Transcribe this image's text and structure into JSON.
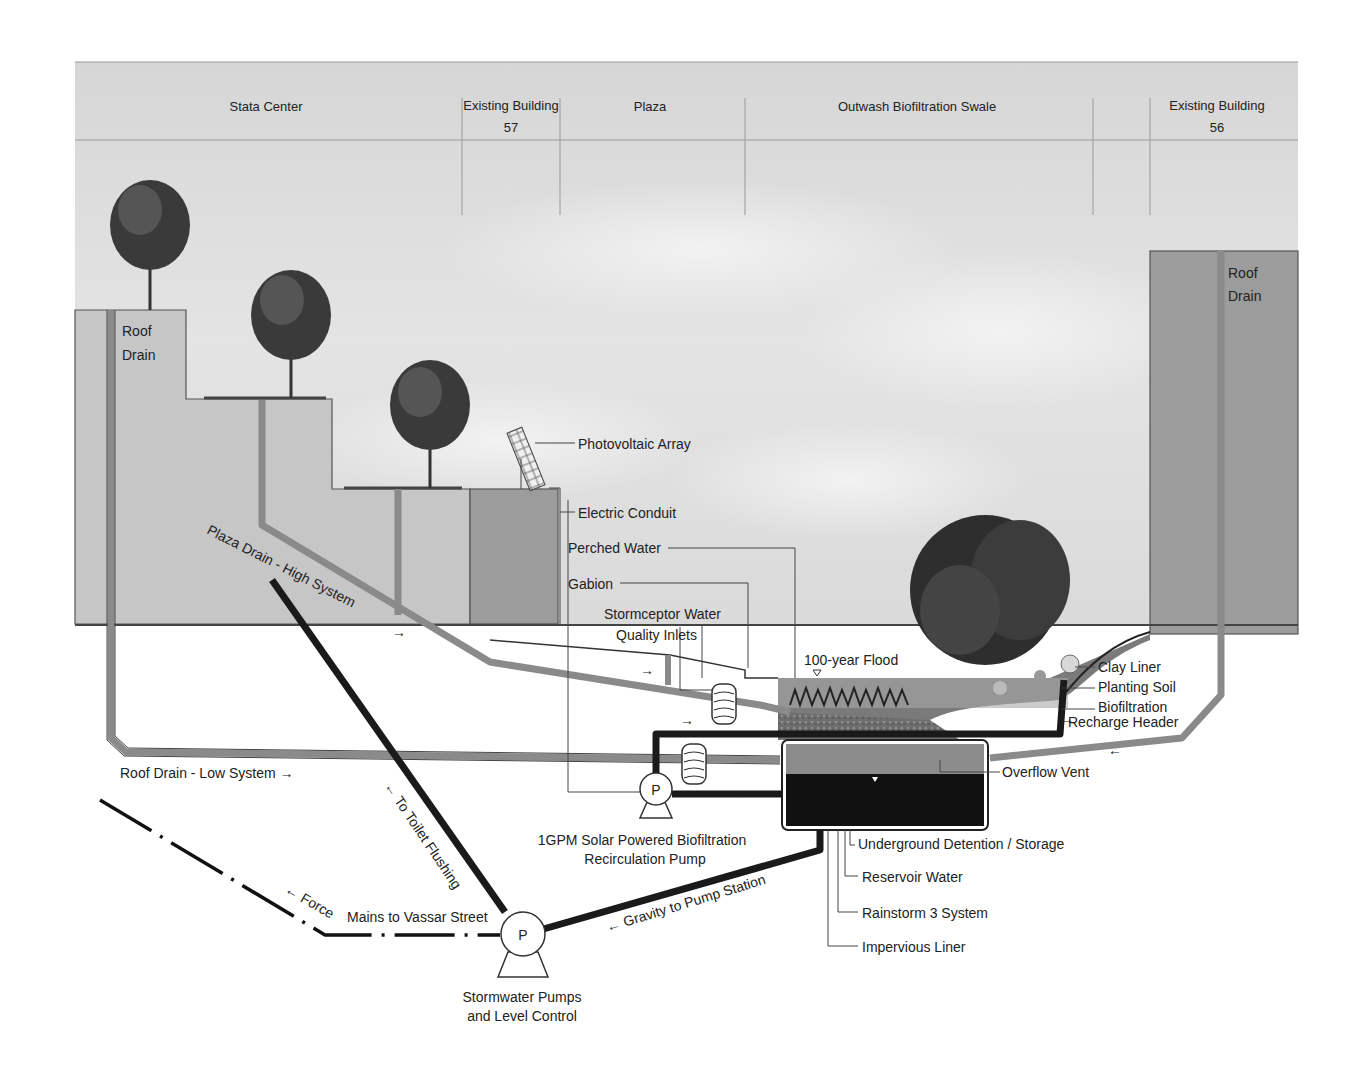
{
  "header": {
    "sections": [
      {
        "label": "Stata Center"
      },
      {
        "label_line1": "Existing Building",
        "label_line2": "57"
      },
      {
        "label": "Plaza"
      },
      {
        "label": "Outwash Biofiltration Swale"
      },
      {
        "label_line1": "Existing Building",
        "label_line2": "56"
      }
    ]
  },
  "labels": {
    "roof_drain_left": {
      "line1": "Roof",
      "line2": "Drain"
    },
    "roof_drain_right": {
      "line1": "Roof",
      "line2": "Drain"
    },
    "photovoltaic_array": "Photovoltaic Array",
    "electric_conduit": "Electric Conduit",
    "perched_water": "Perched Water",
    "gabion": "Gabion",
    "stormceptor": {
      "line1": "Stormceptor Water",
      "line2": "Quality Inlets"
    },
    "flood_100_year": "100-year Flood",
    "clay_liner": "Clay Liner",
    "planting_soil": "Planting Soil",
    "biofiltration": "Biofiltration",
    "recharge_header": "Recharge Header",
    "overflow_vent": "Overflow Vent",
    "plaza_drain_high": "Plaza Drain - High System",
    "roof_drain_low": "Roof Drain - Low System →",
    "to_toilet_flushing": "← To Toilet Flushing",
    "force_mains": "← Force",
    "mains_to_vassar": "Mains to Vassar Street",
    "gravity_to_pump": "← Gravity to Pump Station",
    "recirc_pump": {
      "line1": "1GPM Solar Powered Biofiltration",
      "line2": "Recirculation Pump"
    },
    "stormwater_pumps": {
      "line1": "Stormwater Pumps",
      "line2": "and Level Control"
    },
    "underground_detention": "Underground Detention / Storage",
    "reservoir_water": "Reservoir Water",
    "rainstorm_system": "Rainstorm 3 System",
    "impervious_liner": "Impervious Liner",
    "pump_letter": "P"
  },
  "colors": {
    "sky": "#dcdcdc",
    "building_light": "#c4c4c4",
    "building_dark": "#9a9a9a",
    "pipe_gray": "#8a8a8a",
    "pipe_black": "#1a1a1a",
    "soil": "#7a7a7a",
    "reservoir": "#111111",
    "detention_gray": "#8c8c8c"
  }
}
